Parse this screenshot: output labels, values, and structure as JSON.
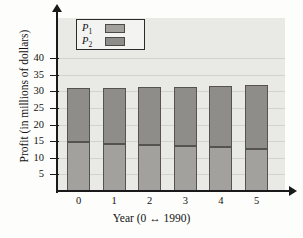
{
  "chart_data": {
    "type": "bar",
    "subtype": "stacked-bar",
    "title": "",
    "xlabel": "Year (0 ↔ 1990)",
    "ylabel": "Profit (in millions of dollars)",
    "categories": [
      "0",
      "1",
      "2",
      "3",
      "4",
      "5"
    ],
    "series": [
      {
        "name": "P₁",
        "key": "P1",
        "values": [
          14.8,
          14.3,
          13.9,
          13.5,
          13.1,
          12.7
        ],
        "color": "#a3a19d"
      },
      {
        "name": "P₂",
        "key": "P2",
        "values": [
          16.2,
          16.8,
          17.3,
          17.9,
          18.5,
          19.1
        ],
        "color": "#8f8d8a"
      }
    ],
    "totals": [
      31.0,
      31.1,
      31.2,
      31.4,
      31.6,
      31.8
    ],
    "ylim": [
      0,
      42
    ],
    "xlim": [
      0,
      6
    ],
    "yticks": [
      5,
      10,
      15,
      20,
      25,
      30,
      35,
      40
    ],
    "ytick_labels": [
      "5",
      "10",
      "15",
      "20",
      "25",
      "30",
      "35",
      "40"
    ],
    "xtick_labels": [
      "0",
      "1",
      "2",
      "3",
      "4",
      "5"
    ],
    "grid": true,
    "grid_axis": "y",
    "legend_position": "upper-left",
    "plot_background": "#e9e9e6",
    "axis_color": "#1a1a1a"
  },
  "legend": {
    "items": [
      {
        "label": "P",
        "sub": "1"
      },
      {
        "label": "P",
        "sub": "2"
      }
    ]
  },
  "axes": {
    "x_title": "Year (0 ↔ 1990)",
    "y_title": "Profit (in millions of dollars)"
  }
}
